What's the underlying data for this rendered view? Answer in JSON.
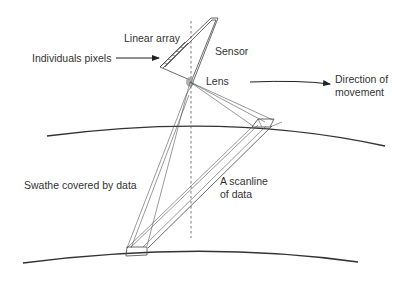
{
  "figure": {
    "labels": {
      "linear_array": "Linear array",
      "individual_pixels": "Individuals pixels",
      "sensor": "Sensor",
      "lens": "Lens",
      "direction_line1": "Direction of",
      "direction_line2": "movement",
      "swathe": "Swathe covered by data",
      "scanline_line1": "A scanline",
      "scanline_line2": "of data"
    },
    "colors": {
      "line": "#444444",
      "text": "#333333",
      "lens": "#9a9a9a",
      "background": "#ffffff"
    }
  }
}
